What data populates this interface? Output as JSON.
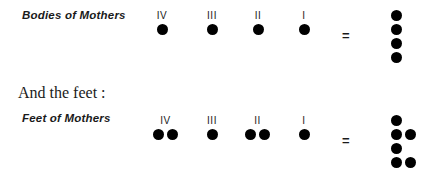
{
  "page": {
    "background_color": "#ffffff",
    "dot_color": "#000000",
    "text_color": "#1a1a1a"
  },
  "section_heading": "And the feet :",
  "equals_symbol": "=",
  "rows": [
    {
      "label": "Bodies of Mothers",
      "columns": [
        {
          "numeral": "IV",
          "dots": 1
        },
        {
          "numeral": "III",
          "dots": 1
        },
        {
          "numeral": "II",
          "dots": 1
        },
        {
          "numeral": "I",
          "dots": 1
        }
      ],
      "result_total": 4,
      "result_rows": [
        1,
        1,
        1,
        1
      ]
    },
    {
      "label": "Feet of Mothers",
      "columns": [
        {
          "numeral": "IV",
          "dots": 2
        },
        {
          "numeral": "III",
          "dots": 1
        },
        {
          "numeral": "II",
          "dots": 2
        },
        {
          "numeral": "I",
          "dots": 1
        }
      ],
      "result_total": 6,
      "result_rows": [
        1,
        2,
        1,
        2
      ]
    }
  ]
}
